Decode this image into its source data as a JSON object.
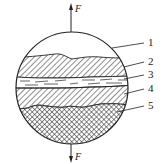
{
  "diagram": {
    "forces": {
      "top": {
        "label": "F",
        "direction": "up"
      },
      "bottom": {
        "label": "F",
        "direction": "down"
      }
    },
    "layers": [
      {
        "number": "1",
        "pattern": "blank"
      },
      {
        "number": "2",
        "pattern": "diagonal-hatch"
      },
      {
        "number": "3",
        "pattern": "dashed-band"
      },
      {
        "number": "4",
        "pattern": "diagonal-hatch"
      },
      {
        "number": "5",
        "pattern": "cross-hatch"
      }
    ],
    "colors": {
      "line": "#222222",
      "background": "#ffffff"
    }
  }
}
